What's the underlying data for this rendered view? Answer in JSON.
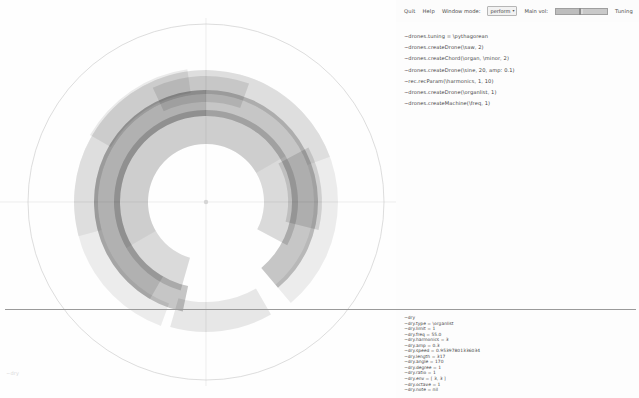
{
  "window": {
    "title": "Drones — radial visualizer"
  },
  "toolbar": {
    "quit_label": "Quit",
    "help_label": "Help",
    "window_mode_label": "Window mode:",
    "window_mode_value": "perform",
    "window_mode_caret": "▾",
    "main_vol_label": "Main vol:",
    "tuning_label": "Tuning",
    "main_vol_value": "0.5"
  },
  "code": {
    "lines": [
      "~drones.tuning = \\pythagorean",
      "~drones.createDrone(\\saw, 2)",
      "~drones.createChord(\\organ, \\minor, 2)",
      "~drones.createDrone(\\sine, 20, amp: 0.1)",
      "~rec.recParam(\\harmonics, 1, 10)",
      "~drones.createDrone(\\organlist, 1)",
      "~drones.createMachine(\\freq, 1)"
    ]
  },
  "status": {
    "lines": [
      "~dry",
      "~dry.type = \\organlist",
      "~dry.limit = 1",
      "~dry.freq = 55.0",
      "~dry.harmonics = 3",
      "~dry.amp = 0.3",
      "~dry.speed = 0.95397801336034",
      "~dry.length = 317",
      "~dry.angle = 170",
      "~dry.degree = 1",
      "~dry.ratio = 1",
      "~dry.env = [ 3, 3 ]",
      "~dry.octave = 1",
      "~dry.note = nil"
    ]
  },
  "viz": {
    "corner_label": "~dry",
    "center": {
      "x": 206,
      "y": 202
    },
    "outer_circle_r": 178,
    "axis_color": "#e2e2e2",
    "outer_circle_color": "#cfcfcf",
    "rings": [
      {
        "name": "outer-halo",
        "r_in": 108,
        "r_out": 132,
        "start": 200,
        "end": 500,
        "fill": "#000000",
        "opacity": 0.07
      },
      {
        "name": "outer-halo-2",
        "r_in": 108,
        "r_out": 132,
        "start": 255,
        "end": 430,
        "fill": "#000000",
        "opacity": 0.06
      },
      {
        "name": "mid-dark",
        "r_in": 86,
        "r_out": 112,
        "start": 192,
        "end": 500,
        "fill": "#000000",
        "opacity": 0.22
      },
      {
        "name": "mid-dark-2",
        "r_in": 86,
        "r_out": 112,
        "start": 210,
        "end": 360,
        "fill": "#000000",
        "opacity": 0.1
      },
      {
        "name": "inner-light",
        "r_in": 58,
        "r_out": 92,
        "start": 196,
        "end": 478,
        "fill": "#000000",
        "opacity": 0.14
      },
      {
        "name": "inner-light-2",
        "r_in": 58,
        "r_out": 92,
        "start": 240,
        "end": 420,
        "fill": "#000000",
        "opacity": 0.05
      },
      {
        "name": "spur-right",
        "r_in": 100,
        "r_out": 126,
        "start": -25,
        "end": 20,
        "fill": "#000000",
        "opacity": 0.1
      },
      {
        "name": "spur-bottom",
        "r_in": 82,
        "r_out": 116,
        "start": 62,
        "end": 104,
        "fill": "#000000",
        "opacity": 0.12
      },
      {
        "name": "spur-left",
        "r_in": 100,
        "r_out": 130,
        "start": 150,
        "end": 196,
        "fill": "#000000",
        "opacity": 0.09
      },
      {
        "name": "spur-topright",
        "r_in": 110,
        "r_out": 134,
        "start": 300,
        "end": 352,
        "fill": "#000000",
        "opacity": 0.08
      }
    ]
  },
  "chart_data": {
    "type": "pie",
    "xlabel": "angle (deg)",
    "ylabel": "radius",
    "categories": [
      "outer-halo",
      "mid-dark",
      "inner-light",
      "spur-right",
      "spur-bottom",
      "spur-left",
      "spur-topright"
    ],
    "values": [
      300,
      308,
      282,
      45,
      42,
      46,
      52
    ],
    "ylim": [
      0,
      178
    ],
    "grid": false,
    "legend": "none",
    "annotations": [
      "~dry"
    ]
  }
}
